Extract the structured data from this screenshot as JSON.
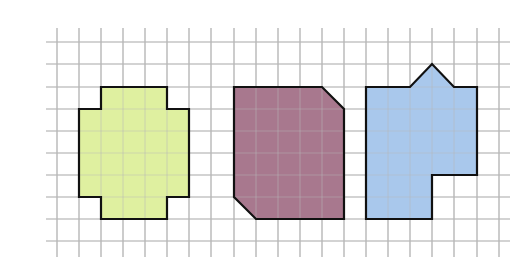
{
  "diagram": {
    "type": "grid-shapes",
    "grid": {
      "x_lines": [
        57,
        79,
        101,
        123,
        145,
        167,
        189,
        211,
        234,
        256,
        278,
        300,
        322,
        344,
        366,
        388,
        410,
        432,
        454,
        477,
        499
      ],
      "y_lines": [
        42,
        64,
        87,
        109,
        131,
        153,
        175,
        197,
        219,
        241
      ],
      "x_extent": [
        46,
        510
      ],
      "y_extent": [
        28,
        257
      ],
      "line_color": "#b8b8b8"
    },
    "shapes": [
      {
        "name": "green-cross-shape",
        "fill": "#dff0a0",
        "stroke": "#111111",
        "points": "101,87 167,87 167,109 189,109 189,197 167,197 167,219 101,219 101,197 79,197 79,109 101,109"
      },
      {
        "name": "purple-chamfered-shape",
        "fill": "#a8788e",
        "stroke": "#111111",
        "points": "234,87 322,87 344,109 344,219 256,219 234,197"
      },
      {
        "name": "blue-house-shape",
        "fill": "#a9c8ec",
        "stroke": "#111111",
        "points": "366,87 410,87 432,64 454,87 477,87 477,175 432,175 432,219 366,219"
      }
    ]
  }
}
